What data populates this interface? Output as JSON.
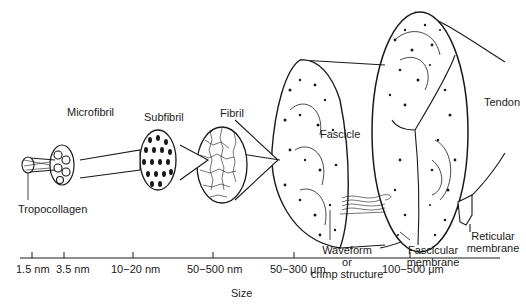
{
  "diagram": {
    "stages": [
      {
        "name": "Tropocollagen",
        "size": "1.5 nm"
      },
      {
        "name": "Microfibril",
        "size": "3.5 nm"
      },
      {
        "name": "Subfibril",
        "size": "10−20 nm"
      },
      {
        "name": "Fibril",
        "size": "50−500 nm"
      },
      {
        "name": "Fascicle",
        "size": "50−300 μm"
      },
      {
        "name": "Tendon",
        "size": "100−500 μm"
      }
    ],
    "labels": {
      "tropocollagen": "Tropocollagen",
      "microfibril": "Microfibril",
      "subfibril": "Subfibril",
      "fibril": "Fibril",
      "fascicle": "Fascicle",
      "tendon": "Tendon",
      "waveform_1": "Waveform",
      "waveform_2": "or",
      "waveform_3": "crimp structure",
      "fascicular_1": "Fascicular",
      "fascicular_2": "membrane",
      "reticular_1": "Reticular",
      "reticular_2": "membrane"
    },
    "axis": {
      "label": "Size",
      "ticks": [
        "1.5 nm",
        "3.5 nm",
        "10−20 nm",
        "50−500 nm",
        "50−300 μm",
        "100−500 μm"
      ]
    }
  }
}
